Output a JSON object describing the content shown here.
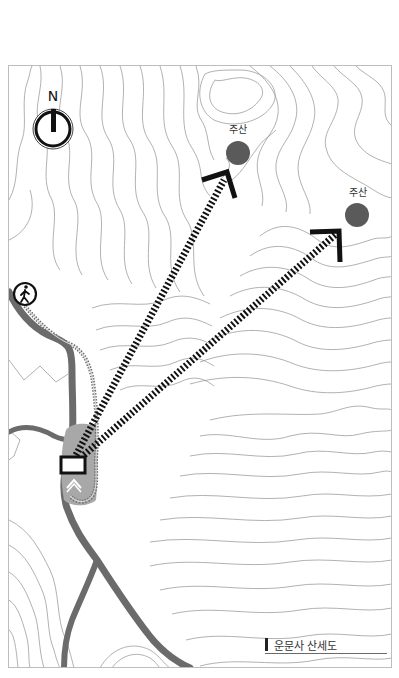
{
  "map": {
    "title": "운문사 산세도",
    "north_label": "N",
    "peaks": [
      {
        "label": "주산",
        "x": 238,
        "y": 153
      },
      {
        "label": "주산",
        "x": 357,
        "y": 215
      }
    ],
    "icons": {
      "compass": "north-compass-icon",
      "hiker": "hiker-icon",
      "temple": "temple-marker-icon",
      "entrance": "entrance-chevron-icon"
    },
    "colors": {
      "peak_fill": "#5a5a5a",
      "river": "#6b6b6b",
      "temple_area": "#a8a8a8",
      "contour": "#8a8a8a",
      "arrow": "#111111",
      "trail": "#8c8c8c"
    }
  }
}
